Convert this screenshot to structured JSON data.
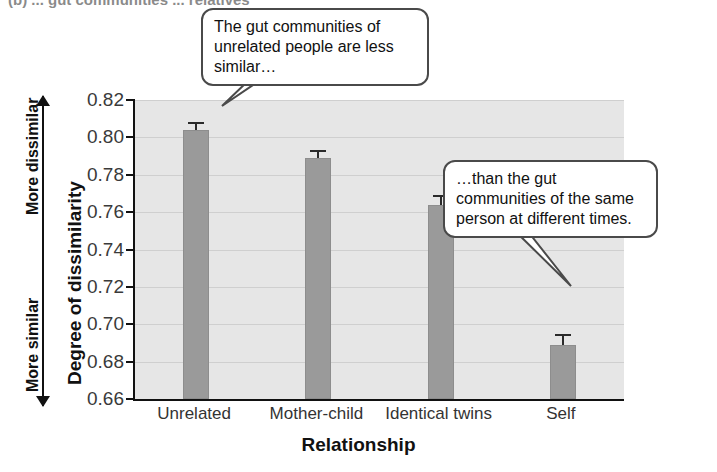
{
  "figure": {
    "top_caption": "(b)  ... gut communities ... relatives",
    "callouts": [
      {
        "id": "callout-unrelated",
        "text": "The gut communities of unrelated people are less similar…"
      },
      {
        "id": "callout-self",
        "text": "…than the gut communities of the same person at different times."
      }
    ]
  },
  "axes": {
    "y_direction_top": "More dissimilar",
    "y_direction_bottom": "More similar"
  },
  "chart_data": {
    "type": "bar",
    "title": "",
    "xlabel": "Relationship",
    "ylabel": "Degree of dissimilarity",
    "categories": [
      "Unrelated",
      "Mother-child",
      "Identical twins",
      "Self"
    ],
    "values": [
      0.804,
      0.789,
      0.764,
      0.689
    ],
    "errors": [
      0.004,
      0.004,
      0.005,
      0.006
    ],
    "ylim": [
      0.66,
      0.82
    ],
    "yticks": [
      0.66,
      0.68,
      0.7,
      0.72,
      0.74,
      0.76,
      0.78,
      0.8,
      0.82
    ],
    "ytick_labels": [
      "0.66",
      "0.68",
      "0.70",
      "0.72",
      "0.74",
      "0.76",
      "0.78",
      "0.80",
      "0.82"
    ],
    "grid": true,
    "legend": false,
    "bar_color": "#9a9a9a",
    "plot_background": "#e6e6e6",
    "error_bar_color": "#2a2a2a"
  }
}
